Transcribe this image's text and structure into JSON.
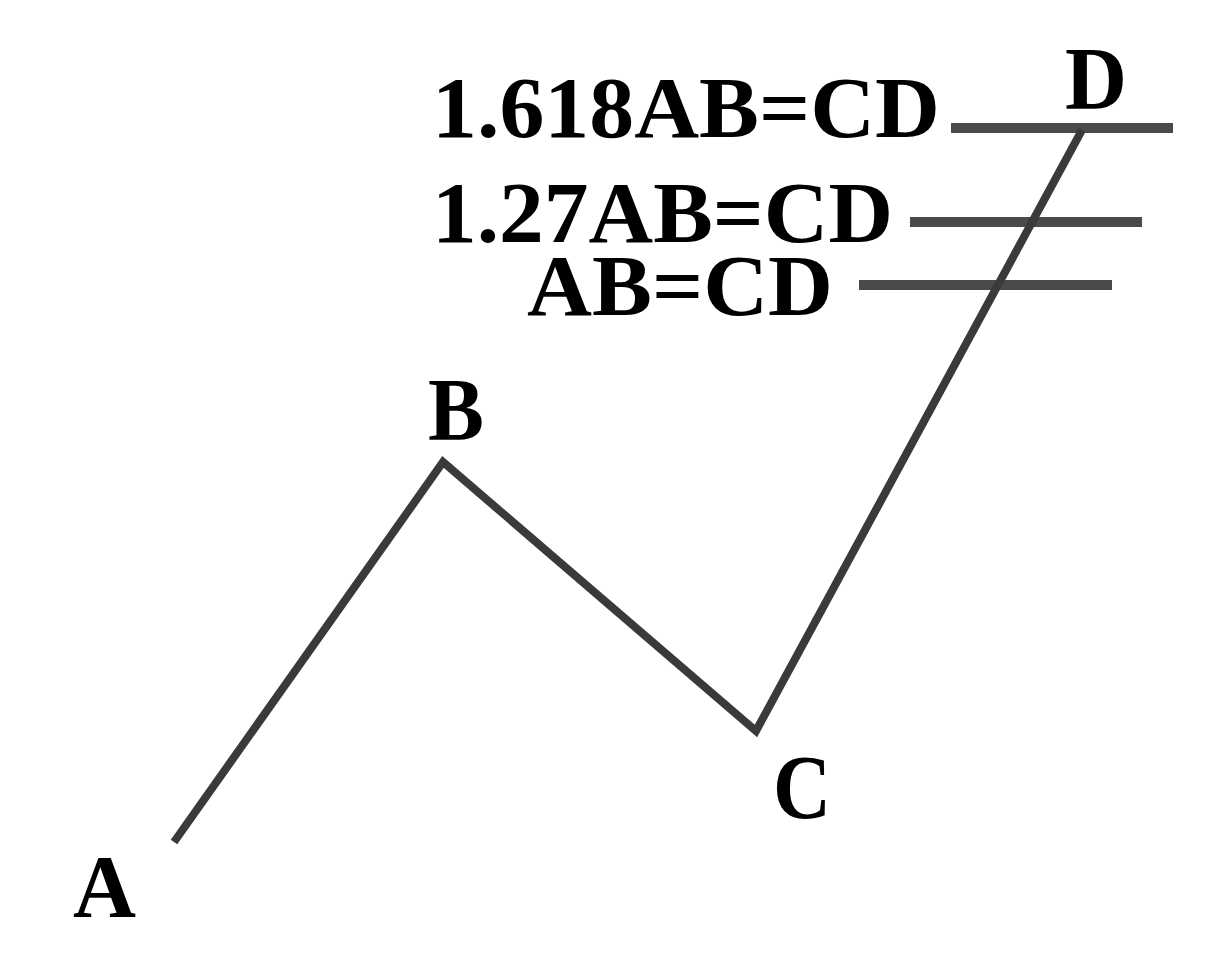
{
  "diagram": {
    "line_color": "#4a4a4a",
    "text_color": "#000000",
    "points": [
      {
        "label": "A",
        "x": 174,
        "y": 842
      },
      {
        "label": "B",
        "x": 443,
        "y": 462
      },
      {
        "label": "C",
        "x": 756,
        "y": 731
      },
      {
        "label": "D",
        "x": 1082,
        "y": 130
      }
    ],
    "point_labels": {
      "a": "A",
      "b": "B",
      "c": "C",
      "d": "D"
    },
    "levels": [
      {
        "label": "1.618AB=CD",
        "y": 128,
        "x1": 951,
        "x2": 1173
      },
      {
        "label": "1.27AB=CD",
        "y": 222,
        "x1": 910,
        "x2": 1142
      },
      {
        "label": "AB=CD",
        "y": 285,
        "x1": 859,
        "x2": 1112
      }
    ]
  }
}
